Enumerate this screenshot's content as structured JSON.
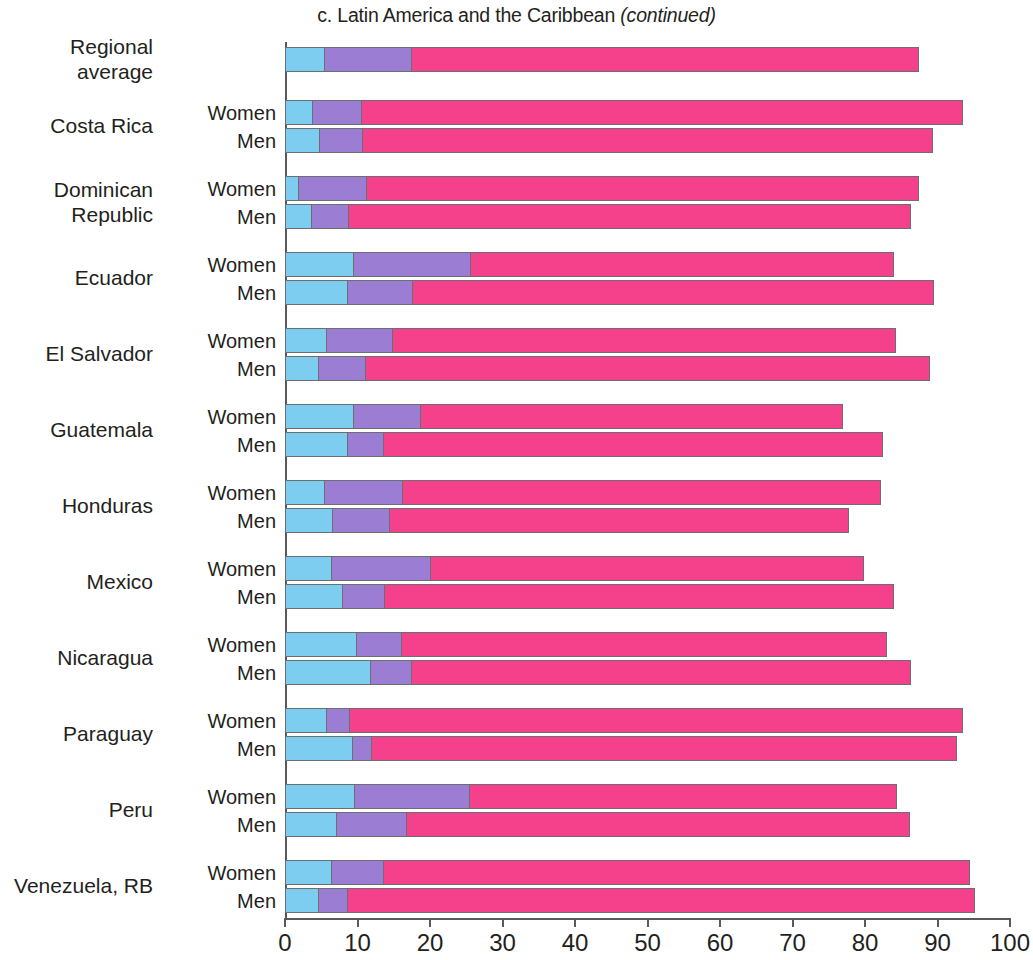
{
  "title": {
    "prefix": "c. Latin America and the Caribbean ",
    "italic": "(continued)",
    "full": "c. Latin America and the Caribbean (continued)"
  },
  "axis": {
    "x_ticks": [
      "0",
      "10",
      "20",
      "30",
      "40",
      "50",
      "60",
      "70",
      "80",
      "90",
      "100"
    ],
    "xlim": [
      0,
      100
    ]
  },
  "colors": {
    "segment1": "#7ccdf0",
    "segment2": "#9b7dd4",
    "segment3": "#f5408c",
    "axis": "#58595b",
    "text": "#231f20"
  },
  "series_labels": {
    "women": "Women",
    "men": "Men"
  },
  "groups": [
    {
      "label": "Regional\naverage",
      "label_flat": "Regional average"
    },
    {
      "label": "Costa Rica",
      "label_flat": "Costa Rica"
    },
    {
      "label": "Dominican\nRepublic",
      "label_flat": "Dominican Republic"
    },
    {
      "label": "Ecuador",
      "label_flat": "Ecuador"
    },
    {
      "label": "El Salvador",
      "label_flat": "El Salvador"
    },
    {
      "label": "Guatemala",
      "label_flat": "Guatemala"
    },
    {
      "label": "Honduras",
      "label_flat": "Honduras"
    },
    {
      "label": "Mexico",
      "label_flat": "Mexico"
    },
    {
      "label": "Nicaragua",
      "label_flat": "Nicaragua"
    },
    {
      "label": "Paraguay",
      "label_flat": "Paraguay"
    },
    {
      "label": "Peru",
      "label_flat": "Peru"
    },
    {
      "label": "Venezuela, RB",
      "label_flat": "Venezuela, RB"
    }
  ],
  "chart_data": {
    "type": "bar",
    "orientation": "horizontal",
    "stacked": true,
    "title": "c. Latin America and the Caribbean (continued)",
    "xlabel": "",
    "ylabel": "",
    "xlim": [
      0,
      100
    ],
    "xticks": [
      0,
      10,
      20,
      30,
      40,
      50,
      60,
      70,
      80,
      90,
      100
    ],
    "grid": false,
    "legend": "none",
    "series": [
      {
        "name": "segment1",
        "color": "#7ccdf0"
      },
      {
        "name": "segment2",
        "color": "#9b7dd4"
      },
      {
        "name": "segment3",
        "color": "#f5408c"
      }
    ],
    "categories": [
      "Regional average",
      "Costa Rica — Women",
      "Costa Rica — Men",
      "Dominican Republic — Women",
      "Dominican Republic — Men",
      "Ecuador — Women",
      "Ecuador — Men",
      "El Salvador — Women",
      "El Salvador — Men",
      "Guatemala — Women",
      "Guatemala — Men",
      "Honduras — Women",
      "Honduras — Men",
      "Mexico — Women",
      "Mexico — Men",
      "Nicaragua — Women",
      "Nicaragua — Men",
      "Paraguay — Women",
      "Paraguay — Men",
      "Peru — Women",
      "Peru — Men",
      "Venezuela, RB — Women",
      "Venezuela, RB — Men"
    ],
    "bars": [
      {
        "group": "Regional average",
        "series": "",
        "segments": [
          5.5,
          12.0,
          70.0
        ],
        "total": 87.5
      },
      {
        "group": "Costa Rica",
        "series": "Women",
        "segments": [
          3.9,
          6.7,
          82.9
        ],
        "total": 93.5
      },
      {
        "group": "Costa Rica",
        "series": "Men",
        "segments": [
          4.8,
          6.0,
          78.6
        ],
        "total": 89.4
      },
      {
        "group": "Dominican Republic",
        "series": "Women",
        "segments": [
          1.9,
          9.4,
          76.1
        ],
        "total": 87.4
      },
      {
        "group": "Dominican Republic",
        "series": "Men",
        "segments": [
          3.7,
          5.1,
          77.5
        ],
        "total": 86.3
      },
      {
        "group": "Ecuador",
        "series": "Women",
        "segments": [
          9.5,
          16.2,
          58.3
        ],
        "total": 84.0
      },
      {
        "group": "Ecuador",
        "series": "Men",
        "segments": [
          8.7,
          9.0,
          71.8
        ],
        "total": 89.5
      },
      {
        "group": "El Salvador",
        "series": "Women",
        "segments": [
          5.8,
          9.1,
          69.4
        ],
        "total": 84.3
      },
      {
        "group": "El Salvador",
        "series": "Men",
        "segments": [
          4.7,
          6.5,
          77.8
        ],
        "total": 89.0
      },
      {
        "group": "Guatemala",
        "series": "Women",
        "segments": [
          9.5,
          9.3,
          58.2
        ],
        "total": 77.0
      },
      {
        "group": "Guatemala",
        "series": "Men",
        "segments": [
          8.7,
          5.0,
          68.8
        ],
        "total": 82.5
      },
      {
        "group": "Honduras",
        "series": "Women",
        "segments": [
          5.5,
          10.8,
          65.9
        ],
        "total": 82.2
      },
      {
        "group": "Honduras",
        "series": "Men",
        "segments": [
          6.6,
          7.9,
          63.3
        ],
        "total": 77.8
      },
      {
        "group": "Mexico",
        "series": "Women",
        "segments": [
          6.5,
          13.6,
          59.8
        ],
        "total": 79.9
      },
      {
        "group": "Mexico",
        "series": "Men",
        "segments": [
          8.0,
          5.8,
          70.2
        ],
        "total": 84.0
      },
      {
        "group": "Nicaragua",
        "series": "Women",
        "segments": [
          9.9,
          6.2,
          66.9
        ],
        "total": 83.0
      },
      {
        "group": "Nicaragua",
        "series": "Men",
        "segments": [
          11.8,
          5.7,
          68.8
        ],
        "total": 86.3
      },
      {
        "group": "Paraguay",
        "series": "Women",
        "segments": [
          5.8,
          3.2,
          84.5
        ],
        "total": 93.5
      },
      {
        "group": "Paraguay",
        "series": "Men",
        "segments": [
          9.4,
          2.6,
          80.7
        ],
        "total": 92.7
      },
      {
        "group": "Peru",
        "series": "Women",
        "segments": [
          9.7,
          15.8,
          58.9
        ],
        "total": 84.4
      },
      {
        "group": "Peru",
        "series": "Men",
        "segments": [
          7.2,
          9.6,
          69.4
        ],
        "total": 86.2
      },
      {
        "group": "Venezuela, RB",
        "series": "Women",
        "segments": [
          6.5,
          7.2,
          80.8
        ],
        "total": 94.5
      },
      {
        "group": "Venezuela, RB",
        "series": "Men",
        "segments": [
          4.7,
          4.0,
          86.5
        ],
        "total": 95.2
      }
    ]
  }
}
